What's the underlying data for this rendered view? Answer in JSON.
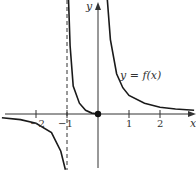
{
  "chart_data": {
    "type": "line",
    "title": "",
    "xlabel": "x",
    "ylabel": "y",
    "curve_label": "y = f(x)",
    "x_ticks": [
      -2,
      -1,
      1,
      2
    ],
    "x_tick_labels": [
      "−2",
      "−1",
      "1",
      "2"
    ],
    "xlim": [
      -3.1,
      3.1
    ],
    "ylim": [
      -1.8,
      3.7
    ],
    "grid": false,
    "vertical_asymptote": -1,
    "horizontal_asymptote": 0,
    "marked_point": {
      "x": 0,
      "y": 0,
      "style": "filled"
    },
    "series": [
      {
        "name": "left branch (x < -1)",
        "x": [
          -3.1,
          -2.5,
          -2,
          -1.5,
          -1.2,
          -1.05
        ],
        "y": [
          -0.12,
          -0.18,
          -0.3,
          -0.6,
          -1.2,
          -1.8
        ]
      },
      {
        "name": "middle branch (-1 < x ≤ 0)",
        "x": [
          -0.95,
          -0.9,
          -0.8,
          -0.6,
          -0.4,
          -0.2,
          0
        ],
        "y": [
          3.7,
          2.2,
          0.9,
          0.35,
          0.12,
          0.03,
          0
        ]
      },
      {
        "name": "right branch (x > 0)",
        "x": [
          0.3,
          0.4,
          0.6,
          0.8,
          1,
          1.5,
          2,
          2.5,
          3.1
        ],
        "y": [
          3.7,
          2.4,
          1.3,
          0.85,
          0.6,
          0.35,
          0.22,
          0.16,
          0.12
        ]
      }
    ]
  },
  "colors": {
    "curve": "#1a1a1a",
    "axis": "#333333",
    "text": "#333333"
  }
}
